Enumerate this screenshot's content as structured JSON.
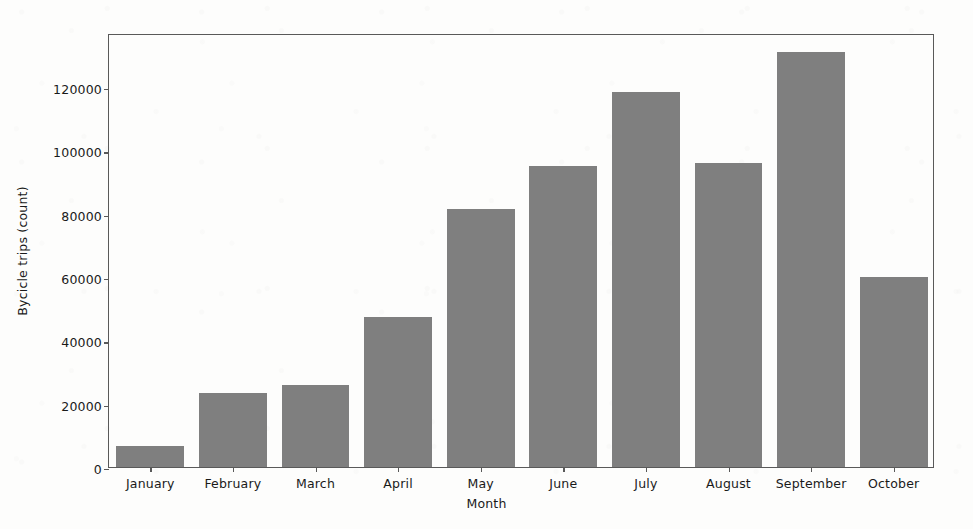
{
  "chart_data": {
    "type": "bar",
    "title": "",
    "xlabel": "Month",
    "ylabel": "Bycicle trips (count)",
    "categories": [
      "January",
      "February",
      "March",
      "April",
      "May",
      "June",
      "July",
      "August",
      "September",
      "October"
    ],
    "values": [
      6500,
      23500,
      26000,
      47500,
      81500,
      95000,
      118500,
      96000,
      131000,
      60000
    ],
    "ylim": [
      0,
      137000
    ],
    "yticks": [
      0,
      20000,
      40000,
      60000,
      80000,
      100000,
      120000
    ],
    "ytick_labels": [
      "0",
      "20000",
      "40000",
      "60000",
      "80000",
      "100000",
      "120000"
    ],
    "grid": false,
    "legend": null,
    "bar_color": "#7f7f7f",
    "axis_color": "#595959",
    "background_color": "#fdfdfc"
  }
}
